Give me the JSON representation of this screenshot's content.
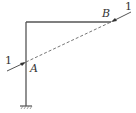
{
  "diagram": {
    "type": "structural-frame",
    "colors": {
      "line": "#555555",
      "text": "#333333"
    },
    "points": {
      "A": {
        "label": "A"
      },
      "B": {
        "label": "B"
      }
    },
    "forces": [
      {
        "label": "1",
        "at": "A"
      },
      {
        "label": "1",
        "at": "B"
      }
    ],
    "support": {
      "type": "fixed"
    }
  }
}
